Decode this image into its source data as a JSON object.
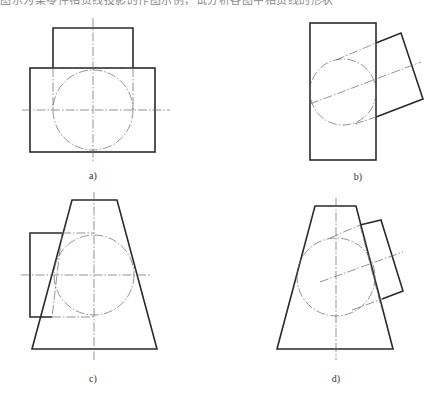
{
  "caption_top": "图示为某零件相贯线投影的作图示例，试分析各图中相贯线的形状",
  "figures": [
    {
      "id": "a",
      "label": "a)",
      "description": "rectangle body with vertical cylinder boss, circle section with centerlines"
    },
    {
      "id": "b",
      "label": "b)",
      "description": "rectangle body with inclined cylinder intersecting"
    },
    {
      "id": "c",
      "label": "c)",
      "description": "trapezoid (cone frustum) with horizontal cylinder from left"
    },
    {
      "id": "d",
      "label": "d)",
      "description": "trapezoid (cone frustum) with inclined cylinder from right"
    }
  ],
  "colors": {
    "line": "#2a2a2a",
    "centerline": "#666666",
    "background": "#ffffff"
  }
}
